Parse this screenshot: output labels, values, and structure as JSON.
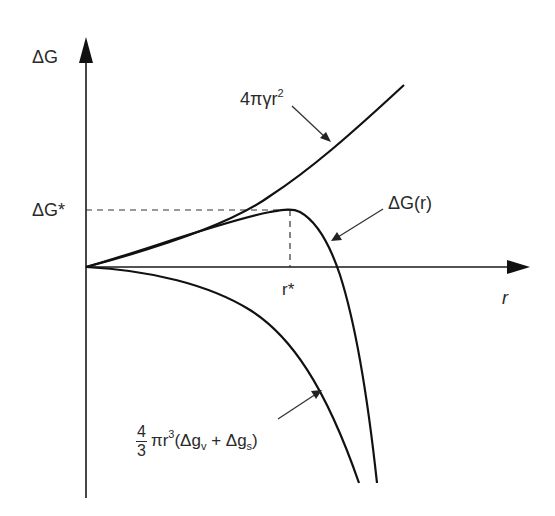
{
  "diagram": {
    "type": "nucleation free energy plot",
    "axes": {
      "y_label": "ΔG",
      "x_label": "r"
    },
    "markers": {
      "critical_energy_label": "ΔG*",
      "critical_radius_label": "r*"
    },
    "curves": [
      {
        "name": "surface-energy-term",
        "label_main": "4πγr",
        "label_sup": "2",
        "shape": "increasing parabola"
      },
      {
        "name": "total-free-energy",
        "label_main": "ΔG(r)",
        "shape": "rises to maximum at r*, then falls"
      },
      {
        "name": "volume-energy-term",
        "label_frac_num": "4",
        "label_frac_den": "3",
        "label_pre": "πr",
        "label_sup": "3",
        "label_open": "(Δg",
        "label_sub_v": "v",
        "label_mid": " + Δg",
        "label_sub_s": "s",
        "label_close": ")",
        "shape": "decreasing cubic"
      }
    ],
    "colors": {
      "line": "#1a1a1a",
      "dash": "#333333",
      "background": "#ffffff"
    }
  }
}
